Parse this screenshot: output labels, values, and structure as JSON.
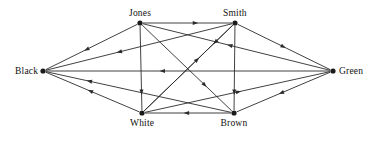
{
  "diagram": {
    "type": "directed-graph",
    "title": "",
    "canvas": {
      "width": 377,
      "height": 142
    },
    "stroke_color": "#2b2b2b",
    "node_color": "#1a1a1a",
    "background_color": "#ffffff",
    "nodes": [
      {
        "id": "black",
        "label": "Black",
        "x": 43,
        "y": 71,
        "label_dx": -33,
        "label_dy": -6
      },
      {
        "id": "jones",
        "label": "Jones",
        "x": 140,
        "y": 23,
        "label_dx": -15,
        "label_dy": -19
      },
      {
        "id": "smith",
        "label": "Smith",
        "x": 235,
        "y": 23,
        "label_dx": -15,
        "label_dy": -19
      },
      {
        "id": "green",
        "label": "Green",
        "x": 333,
        "y": 71,
        "label_dx": 7,
        "label_dy": -6
      },
      {
        "id": "white",
        "label": "White",
        "x": 142,
        "y": 113,
        "label_dx": -15,
        "label_dy": 6
      },
      {
        "id": "brown",
        "label": "Brown",
        "x": 234,
        "y": 113,
        "label_dx": -16,
        "label_dy": 6
      }
    ],
    "edges": [
      {
        "from": "jones",
        "to": "smith",
        "arrow_t": 0.62
      },
      {
        "from": "smith",
        "to": "white",
        "arrow_t": 0.22
      },
      {
        "from": "green",
        "to": "black",
        "arrow_t": 0.6
      },
      {
        "from": "brown",
        "to": "white",
        "arrow_t": 0.55
      },
      {
        "from": "jones",
        "to": "black",
        "arrow_t": 0.58
      },
      {
        "from": "smith",
        "to": "black",
        "arrow_t": 0.62
      },
      {
        "from": "white",
        "to": "black",
        "arrow_t": 0.55
      },
      {
        "from": "brown",
        "to": "black",
        "arrow_t": 0.78
      },
      {
        "from": "smith",
        "to": "green",
        "arrow_t": 0.52
      },
      {
        "from": "green",
        "to": "jones",
        "arrow_t": 0.55
      },
      {
        "from": "green",
        "to": "brown",
        "arrow_t": 0.55
      },
      {
        "from": "white",
        "to": "green",
        "arrow_t": 0.52
      },
      {
        "from": "jones",
        "to": "white",
        "arrow_t": 0.82
      },
      {
        "from": "smith",
        "to": "brown",
        "arrow_t": 0.82
      },
      {
        "from": "jones",
        "to": "brown",
        "arrow_t": 0.72
      },
      {
        "from": "white",
        "to": "smith",
        "arrow_t": 0.62
      }
    ]
  }
}
